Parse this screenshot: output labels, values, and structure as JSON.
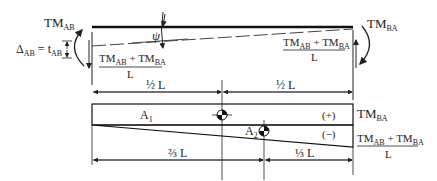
{
  "top": {
    "left_moment": {
      "main": "TM",
      "sub": "AB"
    },
    "right_moment": {
      "main": "TM",
      "sub": "BA"
    },
    "deflection_label": {
      "lhs_main": "Δ",
      "lhs_sub": "AB",
      "eq": " = ",
      "rhs_main": "t",
      "rhs_sub": "AB"
    },
    "angle_label": "ψ",
    "reaction_left": {
      "n1": "TM",
      "s1": "AB",
      "plus": " + ",
      "n2": "TM",
      "s2": "BA",
      "den": "L"
    },
    "reaction_right": {
      "n1": "TM",
      "s1": "AB",
      "plus": " + ",
      "n2": "TM",
      "s2": "BA",
      "den": "L"
    }
  },
  "dims_top": {
    "left": "½ L",
    "right": "½ L"
  },
  "moment_diagram": {
    "area1": {
      "main": "A",
      "sub": "1"
    },
    "area2": {
      "main": "A",
      "sub": "2"
    },
    "sign_pos": "(+)",
    "sign_neg": "(−)",
    "right_top": {
      "main": "TM",
      "sub": "BA"
    },
    "right_bottom": {
      "n1": "TM",
      "s1": "AB",
      "plus": " + ",
      "n2": "TM",
      "s2": "BA",
      "den": "L"
    }
  },
  "dims_bottom": {
    "left": "⅔ L",
    "right": "⅓ L"
  }
}
